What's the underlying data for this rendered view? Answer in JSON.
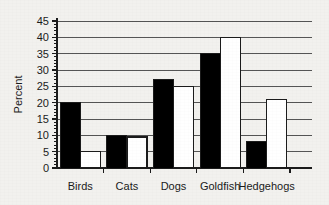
{
  "chart_data": {
    "type": "bar",
    "title": "",
    "xlabel": "",
    "ylabel": "Percent",
    "categories": [
      "Birds",
      "Cats",
      "Dogs",
      "Goldfish",
      "Hedgehogs"
    ],
    "series": [
      {
        "name": "black",
        "fill": "#000000",
        "values": [
          20,
          10,
          27,
          35,
          8
        ]
      },
      {
        "name": "white",
        "fill": "#ffffff",
        "values": [
          5,
          9.5,
          25,
          40,
          21
        ]
      }
    ],
    "ylim": [
      0,
      45
    ],
    "ytick_values": [
      0,
      5,
      10,
      15,
      20,
      25,
      30,
      35,
      40,
      45
    ],
    "ytick_labels": [
      "0",
      "5",
      "10",
      "15",
      "20",
      "25",
      "30",
      "35",
      "40",
      "45"
    ],
    "yminor_step": 1,
    "grid": "horizontal",
    "legend": "none",
    "axis_color": "#1b1b1b",
    "grid_color": "#555555",
    "background_color": "#f2f1ee"
  }
}
